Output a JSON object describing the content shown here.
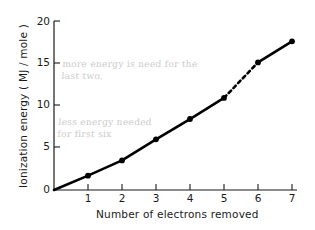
{
  "chart_data": {
    "type": "line",
    "title": "",
    "xlabel": "Number of electrons removed",
    "ylabel": "Ionization energy  ( MJ / mole )",
    "x": [
      0,
      1,
      2,
      3,
      4,
      5,
      6,
      7
    ],
    "values": [
      0,
      1.7,
      3.5,
      6.0,
      8.4,
      10.9,
      15.1,
      17.6
    ],
    "categories": [
      "0",
      "1",
      "2",
      "3",
      "4",
      "5",
      "6",
      "7"
    ],
    "xlim": [
      0,
      7
    ],
    "ylim": [
      0,
      20
    ],
    "xticks": [
      "1",
      "2",
      "3",
      "4",
      "5",
      "6",
      "7"
    ],
    "yticks": [
      "0",
      "5",
      "10",
      "15",
      "20"
    ],
    "grid": false,
    "legend": "none",
    "series": [
      {
        "name": "Ionization energy",
        "values": [
          0,
          1.7,
          3.5,
          6.0,
          8.4,
          10.9,
          15.1,
          17.6
        ],
        "marker": "filled-circle",
        "line_color": "#000000"
      }
    ],
    "dashed_segment": {
      "from_x": 5,
      "to_x": 6,
      "description": "dashed line between electron 5 and electron 6"
    },
    "annotations": [
      {
        "name": "note-more-energy",
        "text": "more energy is need for the\nlast two.",
        "style": "handwritten-pencil"
      },
      {
        "name": "note-less-energy",
        "text": "less energy needed\nfor first six",
        "style": "handwritten-pencil"
      }
    ]
  },
  "axes": {
    "y_title": "Ionization energy  ( MJ / mole )",
    "x_title": "Number of electrons removed",
    "y_tick_labels": [
      "20",
      "15",
      "10",
      "5",
      "0"
    ],
    "x_tick_labels": [
      "1",
      "2",
      "3",
      "4",
      "5",
      "6",
      "7"
    ]
  },
  "annotations": {
    "top": "more energy is need for the\nlast two.",
    "bottom": "less energy needed\nfor first six"
  },
  "colors": {
    "line": "#000000",
    "axis": "#1a1a1a",
    "pencil": "#c8c8c8",
    "background": "#ffffff"
  }
}
